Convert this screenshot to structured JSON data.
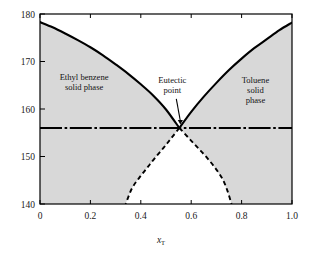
{
  "chart_data": {
    "type": "line",
    "title": "",
    "xlabel": "x_T",
    "xlabel_main": "x",
    "xlabel_sub": "T",
    "ylabel": "",
    "xlim": [
      0,
      1
    ],
    "ylim": [
      140,
      180
    ],
    "xticks": [
      "0",
      "0.2",
      "0.4",
      "0.6",
      "0.8",
      "1.0"
    ],
    "xtick_values": [
      0,
      0.2,
      0.4,
      0.6,
      0.8,
      1.0
    ],
    "yticks": [
      "140",
      "150",
      "160",
      "170",
      "180"
    ],
    "ytick_values": [
      140,
      150,
      160,
      170,
      180
    ],
    "grid": false,
    "legend": "none",
    "eutectic": {
      "x": 0.553,
      "y": 156.0
    },
    "series": [
      {
        "name": "ethyl-benzene-liquidus",
        "style": "solid",
        "color": "#000000",
        "points": [
          [
            0.0,
            178.3
          ],
          [
            0.05,
            177.2
          ],
          [
            0.1,
            175.9
          ],
          [
            0.15,
            174.5
          ],
          [
            0.2,
            173.0
          ],
          [
            0.25,
            171.3
          ],
          [
            0.3,
            169.4
          ],
          [
            0.35,
            167.4
          ],
          [
            0.4,
            165.2
          ],
          [
            0.45,
            162.8
          ],
          [
            0.5,
            159.9
          ],
          [
            0.553,
            156.0
          ]
        ]
      },
      {
        "name": "toluene-liquidus",
        "style": "solid",
        "color": "#000000",
        "points": [
          [
            0.553,
            156.0
          ],
          [
            0.6,
            159.4
          ],
          [
            0.65,
            162.6
          ],
          [
            0.7,
            165.5
          ],
          [
            0.75,
            168.2
          ],
          [
            0.8,
            170.6
          ],
          [
            0.85,
            172.8
          ],
          [
            0.9,
            174.7
          ],
          [
            0.95,
            176.6
          ],
          [
            1.0,
            178.2
          ]
        ]
      },
      {
        "name": "metastable-branch-left",
        "style": "dashed",
        "color": "#000000",
        "points": [
          [
            0.553,
            156.0
          ],
          [
            0.52,
            153.8
          ],
          [
            0.49,
            151.8
          ],
          [
            0.455,
            149.6
          ],
          [
            0.425,
            147.6
          ],
          [
            0.395,
            145.6
          ],
          [
            0.365,
            143.3
          ],
          [
            0.34,
            140.0
          ]
        ]
      },
      {
        "name": "metastable-branch-right",
        "style": "dashed",
        "color": "#000000",
        "points": [
          [
            0.553,
            156.0
          ],
          [
            0.59,
            153.9
          ],
          [
            0.625,
            151.9
          ],
          [
            0.66,
            149.9
          ],
          [
            0.695,
            147.6
          ],
          [
            0.725,
            145.2
          ],
          [
            0.745,
            142.6
          ],
          [
            0.76,
            140.0
          ]
        ]
      },
      {
        "name": "eutectic-tie-line",
        "style": "dash-dot",
        "color": "#000000",
        "points": [
          [
            0.0,
            156.0
          ],
          [
            1.0,
            156.0
          ]
        ]
      }
    ],
    "annotations": [
      {
        "id": "left-region",
        "text_lines": [
          "Ethyl benzene",
          "solid phase"
        ],
        "x": 0.175,
        "y": 166.2
      },
      {
        "id": "eutectic",
        "text_lines": [
          "Eutectic",
          "point"
        ],
        "x": 0.525,
        "y": 165.5
      },
      {
        "id": "right-region",
        "text_lines": [
          "Toluene",
          "solid",
          "phase"
        ],
        "x": 0.855,
        "y": 165.5
      }
    ],
    "colors": {
      "shaded_region": "#d8d8d8",
      "clear_region": "#ffffff",
      "curve": "#000000",
      "frame": "#000000",
      "background": "#ffffff"
    }
  }
}
